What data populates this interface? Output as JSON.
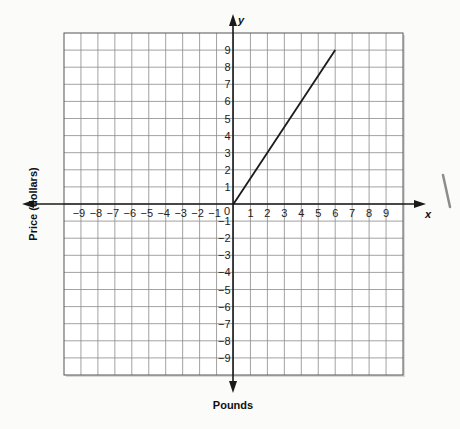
{
  "chart_data": {
    "type": "line",
    "title": "",
    "xlabel": "Pounds",
    "ylabel": "Price (dollars)",
    "x_axis_letter": "x",
    "y_axis_letter": "y",
    "xlim": [
      -10,
      10
    ],
    "ylim": [
      -10,
      10
    ],
    "grid": true,
    "x_ticks": [
      -9,
      -8,
      -7,
      -6,
      -5,
      -4,
      -3,
      -2,
      -1,
      1,
      2,
      3,
      4,
      5,
      6,
      7,
      8,
      9
    ],
    "y_ticks": [
      9,
      8,
      7,
      6,
      5,
      4,
      3,
      2,
      1,
      -1,
      -2,
      -3,
      -4,
      -5,
      -6,
      -7,
      -8,
      -9
    ],
    "origin_label": "0",
    "series": [
      {
        "name": "line",
        "x": [
          0,
          6
        ],
        "y": [
          0,
          9
        ]
      }
    ]
  },
  "colors": {
    "grid": "#8a8a8a",
    "axis": "#1a1a1a",
    "line": "#1a1a1a",
    "background": "#fbfbfa",
    "border": "#555555"
  }
}
